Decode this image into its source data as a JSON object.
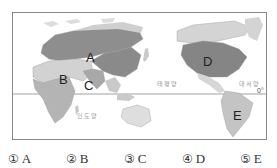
{
  "map": {
    "regions": [
      {
        "id": "A",
        "label": "A",
        "description": "Northern Eurasia (Russia / Central Asia)",
        "color": "#8e8e8e"
      },
      {
        "id": "B",
        "label": "B",
        "description": "North Africa / Middle East",
        "color": "#d2d2d2"
      },
      {
        "id": "C",
        "label": "C",
        "description": "South Asia (India)",
        "color": "#a8a8a8"
      },
      {
        "id": "D",
        "label": "D",
        "description": "North America (USA / Canada)",
        "color": "#858585"
      },
      {
        "id": "E",
        "label": "E",
        "description": "South America (Brazil)",
        "color": "#c4c4c4"
      }
    ],
    "oceans": {
      "indian": "인도양",
      "pacific": "태평양",
      "atlantic": "대서양"
    },
    "equator_label": "0°",
    "colors": {
      "land_default": "#c9c9c9",
      "land_light": "#dedede",
      "china": "#8a8a8a",
      "africa_south": "#b4b4b4",
      "border": "#9a9a9a",
      "equator": "#7a7a7a"
    }
  },
  "choices": [
    {
      "num": "①",
      "label": "A"
    },
    {
      "num": "②",
      "label": "B"
    },
    {
      "num": "③",
      "label": "C"
    },
    {
      "num": "④",
      "label": "D"
    },
    {
      "num": "⑤",
      "label": "E"
    }
  ]
}
